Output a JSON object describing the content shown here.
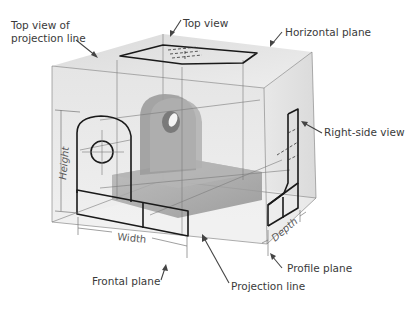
{
  "diagram": {
    "labels": {
      "top_view_projection_line_1": "Top view of",
      "top_view_projection_line_2": "projection line",
      "top_view": "Top view",
      "horizontal_plane": "Horizontal plane",
      "right_side_view": "Right-side view",
      "frontal_plane": "Frontal plane",
      "projection_line": "Projection line",
      "profile_plane": "Profile plane"
    },
    "dimensions": {
      "height": "Height",
      "width": "Width",
      "depth": "Depth"
    },
    "colors": {
      "box_face": "#e6e6e6",
      "box_top": "#eeeeee",
      "box_side": "#dcdcdc",
      "object": "#a8a8a8",
      "view_outline": "#1a1a1a",
      "label_text": "#3a3a3a"
    }
  }
}
